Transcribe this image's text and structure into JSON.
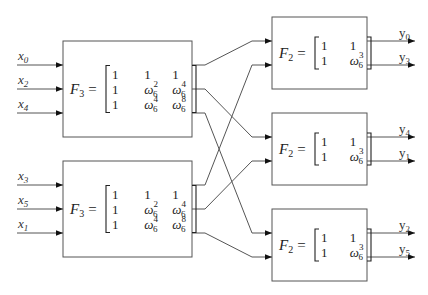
{
  "inputs": [
    {
      "id": "x0",
      "base": "x",
      "sub": "0"
    },
    {
      "id": "x2",
      "base": "x",
      "sub": "2"
    },
    {
      "id": "x4",
      "base": "x",
      "sub": "4"
    },
    {
      "id": "x3",
      "base": "x",
      "sub": "3"
    },
    {
      "id": "x5",
      "base": "x",
      "sub": "5"
    },
    {
      "id": "x1",
      "base": "x",
      "sub": "1"
    }
  ],
  "outputs": [
    {
      "id": "y0",
      "base": "y",
      "sub": "0"
    },
    {
      "id": "y3",
      "base": "y",
      "sub": "3"
    },
    {
      "id": "y4",
      "base": "y",
      "sub": "4"
    },
    {
      "id": "y1",
      "base": "y",
      "sub": "1"
    },
    {
      "id": "y2",
      "base": "y",
      "sub": "2"
    },
    {
      "id": "y5",
      "base": "y",
      "sub": "5"
    }
  ],
  "blocks": {
    "f3": {
      "name": "F",
      "sub": "3",
      "equals": "=",
      "matrix": [
        [
          {
            "v": "1"
          },
          {
            "v": "1"
          },
          {
            "v": "1"
          }
        ],
        [
          {
            "v": "1"
          },
          {
            "v": "ω",
            "sub": "6",
            "sup": "2"
          },
          {
            "v": "ω",
            "sub": "6",
            "sup": "4"
          }
        ],
        [
          {
            "v": "1"
          },
          {
            "v": "ω",
            "sub": "6",
            "sup": "4"
          },
          {
            "v": "ω",
            "sub": "6",
            "sup": "8"
          }
        ]
      ]
    },
    "f2": {
      "name": "F",
      "sub": "2",
      "equals": "=",
      "matrix": [
        [
          {
            "v": "1"
          },
          {
            "v": "1"
          }
        ],
        [
          {
            "v": "1"
          },
          {
            "v": "ω",
            "sub": "6",
            "sup": "3"
          }
        ]
      ]
    }
  },
  "connections": [
    {
      "from": "F3-top.out0",
      "to": "F2-1.in0"
    },
    {
      "from": "F3-top.out1",
      "to": "F2-2.in0"
    },
    {
      "from": "F3-top.out2",
      "to": "F2-3.in0"
    },
    {
      "from": "F3-bottom.out0",
      "to": "F2-1.in1"
    },
    {
      "from": "F3-bottom.out1",
      "to": "F2-2.in1"
    },
    {
      "from": "F3-bottom.out2",
      "to": "F2-3.in1"
    }
  ]
}
